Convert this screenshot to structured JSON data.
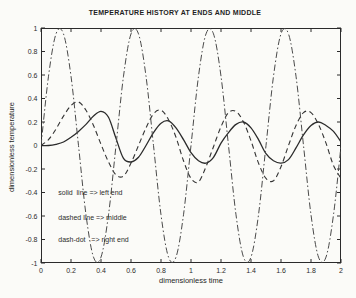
{
  "chart_data": {
    "type": "line",
    "title": "TEMPERATURE HISTORY AT ENDS AND MIDDLE",
    "xlabel": "dimensionless time",
    "ylabel": "dimensionless temperature",
    "xlim": [
      0,
      2
    ],
    "ylim": [
      -1,
      1
    ],
    "grid": false,
    "legend": "text annotations inside plot area",
    "background": "#fbfbf8",
    "ink": "#2b2b2b",
    "xticks": [
      0,
      0.2,
      0.4,
      0.6,
      0.8,
      1,
      1.2,
      1.4,
      1.6,
      1.8,
      2
    ],
    "xtick_labels": [
      "0",
      "0.2",
      "0.4",
      "0.6",
      "0.8",
      "1",
      "1.2",
      "1.4",
      "1.6",
      "1.8",
      "2"
    ],
    "yticks": [
      1,
      0.8,
      0.6,
      0.4,
      0.2,
      0,
      -0.2,
      -0.4,
      -0.6,
      -0.8,
      -1
    ],
    "ytick_labels": [
      "1",
      "0.8",
      "0.6",
      "0.4",
      "0.2",
      "0",
      "-0.2",
      "-0.4",
      "-0.6",
      "-0.8",
      "-1"
    ],
    "x": [
      0,
      0.05,
      0.1,
      0.15,
      0.2,
      0.25,
      0.3,
      0.35,
      0.4,
      0.45,
      0.5,
      0.55,
      0.6,
      0.65,
      0.7,
      0.75,
      0.8,
      0.85,
      0.9,
      0.95,
      1,
      1.05,
      1.1,
      1.15,
      1.2,
      1.25,
      1.3,
      1.35,
      1.4,
      1.45,
      1.5,
      1.55,
      1.6,
      1.65,
      1.7,
      1.75,
      1.8,
      1.85,
      1.9,
      1.95,
      2
    ],
    "series": [
      {
        "name": "left end",
        "linestyle": "solid",
        "color": "#2b2b2b",
        "values": [
          0,
          0,
          0.01,
          0.03,
          0.07,
          0.12,
          0.18,
          0.25,
          0.29,
          0.24,
          0.06,
          -0.11,
          -0.14,
          -0.1,
          0,
          0.11,
          0.19,
          0.21,
          0.15,
          0.05,
          -0.06,
          -0.13,
          -0.15,
          -0.1,
          0.02,
          0.11,
          0.18,
          0.2,
          0.15,
          0.05,
          -0.07,
          -0.13,
          -0.15,
          -0.12,
          -0.02,
          0.09,
          0.17,
          0.2,
          0.17,
          0.12,
          0.03
        ]
      },
      {
        "name": "middle",
        "linestyle": "dashed",
        "color": "#333333",
        "values": [
          0,
          0.05,
          0.14,
          0.25,
          0.34,
          0.37,
          0.3,
          0.17,
          0.01,
          -0.14,
          -0.25,
          -0.26,
          -0.15,
          0,
          0.15,
          0.27,
          0.3,
          0.22,
          0.07,
          -0.13,
          -0.28,
          -0.31,
          -0.18,
          -0.01,
          0.16,
          0.28,
          0.29,
          0.2,
          0.04,
          -0.15,
          -0.28,
          -0.3,
          -0.18,
          0,
          0.17,
          0.28,
          0.28,
          0.18,
          0.02,
          -0.17,
          -0.28
        ]
      },
      {
        "name": "right end",
        "linestyle": "dash-dot",
        "color": "#4a4a4a",
        "values": [
          0,
          0.59,
          0.95,
          0.95,
          0.59,
          0,
          -0.59,
          -0.95,
          -0.95,
          -0.59,
          0,
          0.59,
          0.95,
          0.95,
          0.59,
          0,
          -0.59,
          -0.95,
          -0.95,
          -0.59,
          0,
          0.59,
          0.95,
          0.95,
          0.59,
          0,
          -0.59,
          -0.95,
          -0.95,
          -0.59,
          0,
          0.59,
          0.95,
          0.95,
          0.59,
          0,
          -0.59,
          -0.95,
          -0.95,
          -0.59,
          0
        ]
      }
    ],
    "annotations": [
      {
        "text": "solid  line => left end",
        "x": 0.115,
        "y": -0.4
      },
      {
        "text": "dashed line => middle",
        "x": 0.115,
        "y": -0.61
      },
      {
        "text": "dash-dot   => right end",
        "x": 0.115,
        "y": -0.8
      }
    ]
  }
}
